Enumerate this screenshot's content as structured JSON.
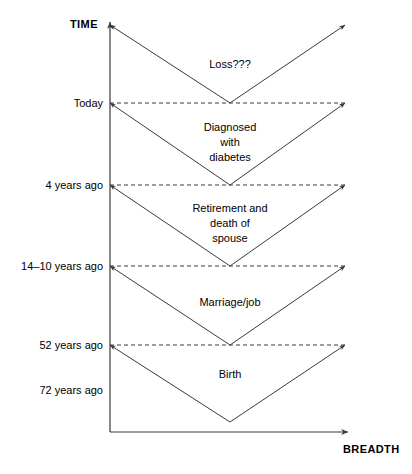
{
  "figure": {
    "kind": "life-course-funnel-diagram",
    "background_color": "#ffffff",
    "line_color": "#3a3a3a",
    "text_color": "#000000"
  },
  "axes": {
    "vertical": {
      "name": "TIME",
      "label": "TIME",
      "x": 110,
      "top_y": 22,
      "bottom_y": 432,
      "arrow": "up"
    },
    "horizontal": {
      "name": "BREADTH",
      "label": "BREADTH",
      "y": 432,
      "left_x": 110,
      "right_x": 348,
      "arrow": "right"
    }
  },
  "time_labels": [
    {
      "id": "today",
      "text": "Today",
      "y": 103
    },
    {
      "id": "four-years-ago",
      "text": "4 years ago",
      "y": 185
    },
    {
      "id": "fourteen-ten-years-ago",
      "text": "14–10 years ago",
      "y": 266
    },
    {
      "id": "fiftytwo-years-ago",
      "text": "52 years ago",
      "y": 345
    },
    {
      "id": "seventytwo-years-ago",
      "text": "72 years ago",
      "y": 390
    }
  ],
  "gridlines": [
    {
      "id": "gridline-today",
      "y": 103,
      "style": "dashed"
    },
    {
      "id": "gridline-4-years",
      "y": 185,
      "style": "dashed"
    },
    {
      "id": "gridline-14-10-years",
      "y": 266,
      "style": "dashed"
    },
    {
      "id": "gridline-52-years",
      "y": 345,
      "style": "dashed"
    }
  ],
  "bands": [
    {
      "id": "band-loss",
      "label": "Loss???",
      "text_x": 230,
      "text_y": 57,
      "top_y": 25,
      "vertex_y": 103,
      "vertex_x": 230,
      "left_x": 110,
      "right_x": 345
    },
    {
      "id": "band-diagnosed-with-diabetes",
      "label": "Diagnosed\nwith\ndiabetes",
      "text_x": 230,
      "text_y": 120,
      "top_y": 103,
      "vertex_y": 185,
      "vertex_x": 230,
      "left_x": 110,
      "right_x": 345
    },
    {
      "id": "band-retirement-and-death-of-spouse",
      "label": "Retirement and\ndeath of\nspouse",
      "text_x": 230,
      "text_y": 201,
      "top_y": 185,
      "vertex_y": 266,
      "vertex_x": 230,
      "left_x": 110,
      "right_x": 345
    },
    {
      "id": "band-marriage-job",
      "label": "Marriage/job",
      "text_x": 230,
      "text_y": 295,
      "top_y": 266,
      "vertex_y": 345,
      "vertex_x": 230,
      "left_x": 110,
      "right_x": 345
    },
    {
      "id": "band-birth",
      "label": "Birth",
      "text_x": 230,
      "text_y": 367,
      "top_y": 345,
      "vertex_y": 422,
      "vertex_x": 230,
      "left_x": 110,
      "right_x": 345
    }
  ]
}
